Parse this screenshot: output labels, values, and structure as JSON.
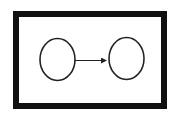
{
  "diagram": {
    "frame": {
      "x": 13,
      "y": 11,
      "width": 154,
      "height": 98,
      "stroke_width": 6,
      "color": "#111111"
    },
    "nodes": [
      {
        "id": "node-left",
        "cx": 57.5,
        "cy": 59.5,
        "rx": 17.5,
        "ry": 21,
        "label": ""
      },
      {
        "id": "node-right",
        "cx": 126.5,
        "cy": 58.5,
        "rx": 17.5,
        "ry": 21,
        "label": ""
      }
    ],
    "edges": [
      {
        "from": "node-left",
        "to": "node-right",
        "x1": 75,
        "y1": 60.5,
        "x2": 108,
        "y2": 60.5,
        "label": ""
      }
    ],
    "colors": {
      "stroke": "#222222",
      "background": "#ffffff"
    }
  }
}
